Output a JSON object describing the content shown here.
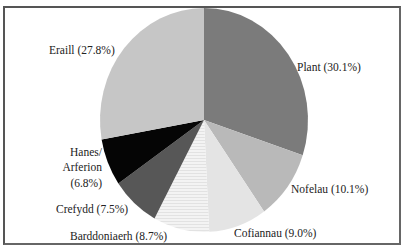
{
  "chart_data": {
    "type": "pie",
    "title": "",
    "start": "top",
    "direction": "clockwise",
    "slices": [
      {
        "label": "Plant",
        "value": 30.1,
        "display": "Plant (30.1%)",
        "color": "#7b7b7b"
      },
      {
        "label": "Nofelau",
        "value": 10.1,
        "display": "Nofelau (10.1%)",
        "color": "#b9b9b9"
      },
      {
        "label": "Cofiannau",
        "value": 9.0,
        "display": "Cofiannau (9.0%)",
        "color": "#e4e4e4"
      },
      {
        "label": "Barddoniaerh",
        "value": 8.7,
        "display": "Barddoniaerh (8.7%)",
        "color": "#f1f1f1"
      },
      {
        "label": "Crefydd",
        "value": 7.5,
        "display": "Crefydd (7.5%)",
        "color": "#575757"
      },
      {
        "label": "Hanes/Arferion",
        "value": 6.8,
        "display_lines": [
          "Hanes/",
          "Arferion",
          "(6.8%)"
        ],
        "color": "#050505"
      },
      {
        "label": "Eraill",
        "value": 27.8,
        "display": "Eraill (27.8%)",
        "color": "#c6c6c6"
      }
    ]
  }
}
